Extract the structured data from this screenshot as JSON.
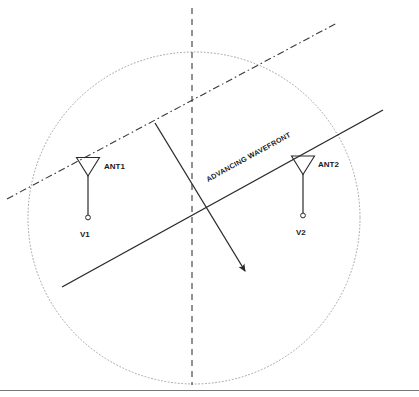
{
  "diagram": {
    "background_color": "#ffffff",
    "line_color": "#1a1a1a",
    "circle_color": "#999999",
    "labels": {
      "antenna1": "ANT1",
      "antenna2": "ANT2",
      "voltage1": "V1",
      "voltage2": "V2",
      "wavefront": "ADVANCING WAVEFRONT"
    },
    "geometry": {
      "circle": {
        "cx": 194,
        "cy": 218,
        "r": 166
      },
      "vertical_axis": {
        "x": 192,
        "y1": 8,
        "y2": 385
      },
      "boresight_line": {
        "x1": 7,
        "y1": 199,
        "x2": 337,
        "y2": 23
      },
      "wavefront_line": {
        "x1": 62,
        "y1": 287,
        "x2": 383,
        "y2": 110
      },
      "propagation_arrow": {
        "x1": 155,
        "y1": 123,
        "x2": 248,
        "y2": 275
      },
      "antenna1": {
        "x": 88,
        "y_top": 157,
        "y_terminal": 218
      },
      "antenna2": {
        "x": 303,
        "y_top": 156,
        "y_terminal": 216
      },
      "baseline_rule": {
        "y": 390
      }
    }
  }
}
